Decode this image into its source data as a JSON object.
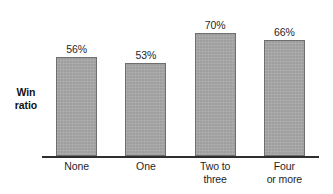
{
  "chart_data": {
    "type": "bar",
    "title": "",
    "subtitle": "",
    "xlabel": "",
    "ylabel": "Win ratio",
    "categories": [
      "None",
      "One",
      "Two to three",
      "Four or more"
    ],
    "values": [
      56,
      53,
      70,
      66
    ],
    "value_labels": [
      "56%",
      "53%",
      "70%",
      "66%"
    ],
    "ylim": [
      0,
      76
    ],
    "grid": false,
    "legend": null,
    "annotations": [],
    "colors": {
      "bar_fill": "#a9a9a9",
      "bar_border": "#6e6e6e",
      "axis": "#2e2e2e",
      "text": "#1f1f1f",
      "background": "#ffffff"
    }
  },
  "axis": {
    "y_label_lines": [
      "Win",
      "ratio"
    ]
  },
  "bars": [
    {
      "category_lines": [
        "None"
      ],
      "value_label": "56%",
      "value": 56
    },
    {
      "category_lines": [
        "One"
      ],
      "value_label": "53%",
      "value": 53
    },
    {
      "category_lines": [
        "Two to",
        "three"
      ],
      "value_label": "70%",
      "value": 70
    },
    {
      "category_lines": [
        "Four",
        "or more"
      ],
      "value_label": "66%",
      "value": 66
    }
  ]
}
